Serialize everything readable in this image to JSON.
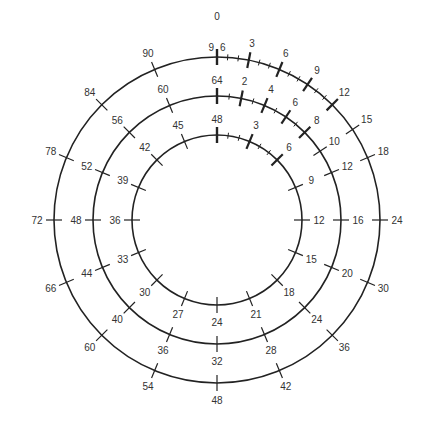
{
  "diagram": {
    "title_label": "0",
    "center": [
      217,
      220
    ],
    "stroke_color": "#222222",
    "text_color": "#333333",
    "rings": [
      {
        "name": "inner",
        "radius": 85,
        "modulus": 48,
        "top_label": "48",
        "labels": [
          "3",
          "6",
          "9",
          "12",
          "15",
          "18",
          "21",
          "24",
          "27",
          "30",
          "33",
          "36",
          "39",
          "42",
          "45"
        ],
        "label_values": [
          3,
          6,
          9,
          12,
          15,
          18,
          21,
          24,
          27,
          30,
          33,
          36,
          39,
          42,
          45
        ],
        "minor_ticks": [
          1,
          2,
          4,
          5
        ]
      },
      {
        "name": "middle",
        "radius": 124,
        "modulus": 64,
        "top_label": "64",
        "labels": [
          "2",
          "4",
          "6",
          "8",
          "10",
          "12",
          "16",
          "20",
          "24",
          "28",
          "32",
          "36",
          "40",
          "44",
          "48",
          "52",
          "56",
          "60"
        ],
        "label_values": [
          2,
          4,
          6,
          8,
          10,
          12,
          16,
          20,
          24,
          28,
          32,
          36,
          40,
          44,
          48,
          52,
          56,
          60
        ],
        "minor_ticks": [
          1,
          3,
          5,
          7
        ]
      },
      {
        "name": "outer",
        "radius": 163,
        "modulus": 96,
        "top_label_left": "9",
        "top_label_right": "6",
        "labels": [
          "3",
          "6",
          "9",
          "12",
          "15",
          "18",
          "24",
          "30",
          "36",
          "42",
          "48",
          "54",
          "60",
          "66",
          "72",
          "78",
          "84",
          "90"
        ],
        "label_values": [
          3,
          6,
          9,
          12,
          15,
          18,
          24,
          30,
          36,
          42,
          48,
          54,
          60,
          66,
          72,
          78,
          84,
          90
        ],
        "minor_ticks": [
          1,
          2,
          4,
          5,
          7,
          8,
          10,
          11
        ]
      }
    ]
  }
}
